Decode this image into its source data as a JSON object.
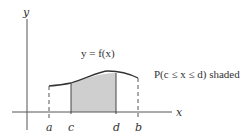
{
  "diagram": {
    "axes": {
      "x_label": "x",
      "y_label": "y"
    },
    "curve_label": "y = f(x)",
    "annotation": "P(c ≤ x ≤ d) shaded",
    "points": [
      {
        "name": "a",
        "label": "a"
      },
      {
        "name": "c",
        "label": "c"
      },
      {
        "name": "d",
        "label": "d"
      },
      {
        "name": "b",
        "label": "b"
      }
    ],
    "colors": {
      "shade": "#cfcfcf",
      "line": "#333333"
    }
  }
}
